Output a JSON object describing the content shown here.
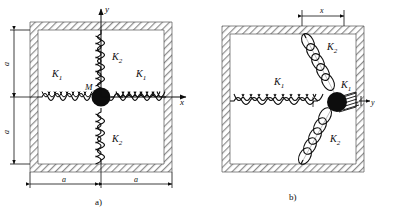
{
  "figure": {
    "caption_a": "a)",
    "caption_b": "b)",
    "background": "#ffffff",
    "ink": "#0d0d0d",
    "wall_hatch_color": "#8c8c8c"
  },
  "panel_a": {
    "name": "equilibrium-configuration",
    "mass_label": "M",
    "springs": [
      {
        "id": "spring-left",
        "label": "K_1",
        "label_text": "K",
        "sub": "1",
        "orientation": "horizontal",
        "side": "left"
      },
      {
        "id": "spring-right",
        "label": "K_1",
        "label_text": "K",
        "sub": "1",
        "orientation": "horizontal",
        "side": "right"
      },
      {
        "id": "spring-top",
        "label": "K_2",
        "label_text": "K",
        "sub": "2",
        "orientation": "vertical",
        "side": "top"
      },
      {
        "id": "spring-bottom",
        "label": "K_2",
        "label_text": "K",
        "sub": "2",
        "orientation": "vertical",
        "side": "bottom"
      }
    ],
    "axes": [
      {
        "id": "axis-y",
        "label": "y",
        "direction": "up"
      },
      {
        "id": "axis-x",
        "label": "x",
        "direction": "right"
      }
    ],
    "dimensions": [
      {
        "id": "dim-left-upper",
        "label": "a",
        "orientation": "vertical"
      },
      {
        "id": "dim-left-lower",
        "label": "a",
        "orientation": "vertical"
      },
      {
        "id": "dim-bottom-left",
        "label": "a",
        "orientation": "horizontal"
      },
      {
        "id": "dim-bottom-right",
        "label": "a",
        "orientation": "horizontal"
      }
    ]
  },
  "panel_b": {
    "name": "displaced-configuration",
    "springs": [
      {
        "id": "spring-left",
        "label": "K_1",
        "label_text": "K",
        "sub": "1",
        "state": "stretched"
      },
      {
        "id": "spring-right",
        "label": "K_1",
        "label_text": "K",
        "sub": "1",
        "state": "compressed"
      },
      {
        "id": "spring-top",
        "label": "K_2",
        "label_text": "K",
        "sub": "2",
        "state": "stretched"
      },
      {
        "id": "spring-bottom",
        "label": "K_2",
        "label_text": "K",
        "sub": "2",
        "state": "stretched"
      }
    ],
    "dimensions": [
      {
        "id": "dim-top-x",
        "label": "x",
        "orientation": "horizontal"
      }
    ],
    "axes": [
      {
        "id": "axis-y",
        "label": "y",
        "direction": "right"
      }
    ]
  }
}
